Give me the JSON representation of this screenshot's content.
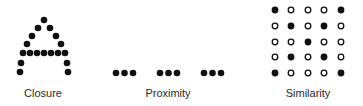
{
  "panels": [
    {
      "id": "closure",
      "label": "Closure",
      "description": "Dots arranged to outline the letter A",
      "shape": "letter-A",
      "dot_style": "filled"
    },
    {
      "id": "proximity",
      "label": "Proximity",
      "description": "Nine dots in three groups of three",
      "groups": 3,
      "dots_per_group": 3,
      "dot_style": "filled"
    },
    {
      "id": "similarity",
      "label": "Similarity",
      "description": "5x5 grid of filled and hollow circles forming an X",
      "grid": [
        [
          1,
          0,
          0,
          0,
          1
        ],
        [
          0,
          1,
          0,
          1,
          0
        ],
        [
          0,
          0,
          1,
          0,
          0
        ],
        [
          0,
          1,
          0,
          1,
          0
        ],
        [
          1,
          0,
          0,
          0,
          1
        ]
      ],
      "legend": {
        "1": "filled",
        "0": "hollow"
      }
    }
  ],
  "colors": {
    "dot": "#111111",
    "text": "#2a2a2a",
    "background": "#ffffff"
  }
}
